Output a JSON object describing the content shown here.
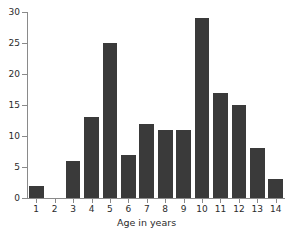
{
  "chart_data": {
    "type": "bar",
    "title": "",
    "xlabel": "Age in years",
    "ylabel": "",
    "categories": [
      "1",
      "2",
      "3",
      "4",
      "5",
      "6",
      "7",
      "8",
      "9",
      "10",
      "11",
      "12",
      "13",
      "14"
    ],
    "values": [
      2,
      0,
      6,
      13,
      25,
      7,
      12,
      11,
      11,
      29,
      17,
      15,
      8,
      3
    ],
    "ylim": [
      0,
      30
    ],
    "yticks": [
      "0",
      "5",
      "10",
      "15",
      "20",
      "25",
      "30"
    ],
    "ytick_values": [
      0,
      5,
      10,
      15,
      20,
      25,
      30
    ],
    "grid": false,
    "legend": "none",
    "bar_color": "#3a3a3a",
    "axis_color": "#8a8a8a",
    "text_color": "#2b2b2b",
    "background_color": "#ffffff"
  }
}
